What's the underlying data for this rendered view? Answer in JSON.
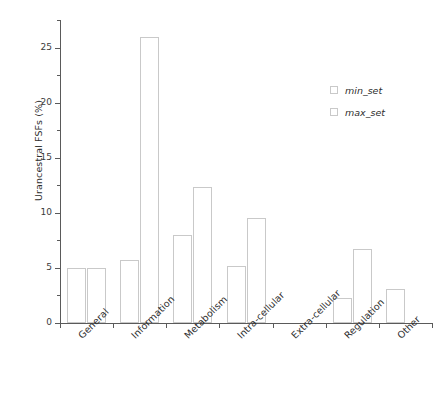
{
  "chart_data": {
    "type": "bar",
    "title": "",
    "subtitle": "",
    "xlabel": "",
    "ylabel": "Urancestral FSFs (%)",
    "categories": [
      "General",
      "Information",
      "Metabolism",
      "Intra-cellular",
      "Extra-cellular",
      "Regulation",
      "Other"
    ],
    "series": [
      {
        "name": "min_set",
        "values": [
          5.0,
          5.7,
          8.0,
          5.2,
          0.0,
          2.3,
          3.1
        ]
      },
      {
        "name": "max_set",
        "values": [
          5.0,
          26.0,
          12.3,
          9.5,
          0.0,
          6.7,
          0.0
        ]
      }
    ],
    "ylim": [
      0,
      27.5
    ],
    "yticks": [
      0,
      5,
      10,
      15,
      20,
      25
    ],
    "ytick_labels": [
      "0",
      "5",
      "10",
      "15",
      "20",
      "25"
    ],
    "y_minor_ticks": [
      2.5,
      7.5,
      12.5,
      17.5,
      22.5,
      27.5
    ],
    "grid": false,
    "legend_position": "upper right",
    "bar_facecolor": "#ffffff",
    "bar_edgecolor": "#c9c9c9",
    "axis_color": "#5a5a5a",
    "text_color": "#2e2e2e",
    "background": "#ffffff"
  },
  "legend": {
    "entries": [
      {
        "label": "min_set"
      },
      {
        "label": "max_set"
      }
    ]
  },
  "axes": {
    "y_title": "Urancestral FSFs (%)",
    "y_tick_labels": [
      "25",
      "20",
      "15",
      "10",
      "5",
      "0"
    ],
    "x_tick_labels": [
      "General",
      "Information",
      "Metabolism",
      "Intra-cellular",
      "Extra-cellular",
      "Regulation",
      "Other"
    ]
  }
}
